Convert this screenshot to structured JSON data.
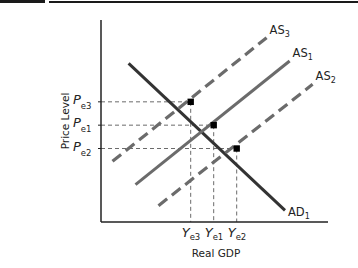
{
  "chart_data": {
    "type": "line",
    "title": "",
    "xlabel": "Real GDP",
    "ylabel": "Price Level",
    "grid": false,
    "colors": {
      "axis": "#222222",
      "ad": "#333333",
      "as_solid": "#6b6b6b",
      "as_dashed": "#6b6b6b",
      "guide": "#6b6b6b",
      "point": "#000000"
    },
    "curves": [
      {
        "id": "AD",
        "label_main": "AD",
        "label_sub": "1",
        "style": "solid-dark",
        "points": [
          [
            1.2,
            6.8
          ],
          [
            8.0,
            0.5
          ]
        ]
      },
      {
        "id": "AS3",
        "label_main": "AS",
        "label_sub": "3",
        "style": "dashed",
        "points": [
          [
            0.5,
            2.6
          ],
          [
            7.2,
            7.9
          ]
        ]
      },
      {
        "id": "AS1",
        "label_main": "AS",
        "label_sub": "1",
        "style": "solid",
        "points": [
          [
            1.5,
            1.6
          ],
          [
            8.2,
            6.9
          ]
        ]
      },
      {
        "id": "AS2",
        "label_main": "AS",
        "label_sub": "2",
        "style": "dashed",
        "points": [
          [
            2.5,
            0.7
          ],
          [
            9.2,
            5.9
          ]
        ]
      }
    ],
    "equilibria": [
      {
        "id": "E3",
        "x": 3.9,
        "y": 5.15,
        "x_label_main": "Y",
        "x_label_sub": "e3",
        "y_label_main": "P",
        "y_label_sub": "e3"
      },
      {
        "id": "E1",
        "x": 4.9,
        "y": 4.15,
        "x_label_main": "Y",
        "x_label_sub": "e1",
        "y_label_main": "P",
        "y_label_sub": "e1"
      },
      {
        "id": "E2",
        "x": 5.9,
        "y": 3.15,
        "x_label_main": "Y",
        "x_label_sub": "e2",
        "y_label_main": "P",
        "y_label_sub": "e2"
      }
    ],
    "xlim": [
      0,
      10
    ],
    "ylim": [
      0,
      9
    ]
  }
}
